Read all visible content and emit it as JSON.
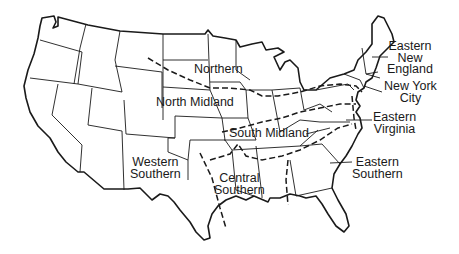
{
  "map": {
    "title": "",
    "subject": "United States dialect regions",
    "colors": {
      "line": "#1a1a1a",
      "background": "#ffffff"
    },
    "regions": [
      {
        "id": "northern",
        "label": "Northern"
      },
      {
        "id": "north-midland",
        "label": "North Midland"
      },
      {
        "id": "south-midland",
        "label": "South Midland"
      },
      {
        "id": "western-southern",
        "label_line1": "Western",
        "label_line2": "Southern"
      },
      {
        "id": "central-southern",
        "label_line1": "Central",
        "label_line2": "Southern"
      },
      {
        "id": "eastern-new-england",
        "label_line1": "Eastern",
        "label_line2": "New",
        "label_line3": "England"
      },
      {
        "id": "new-york-city",
        "label_line1": "New York",
        "label_line2": "City"
      },
      {
        "id": "eastern-virginia",
        "label_line1": "Eastern",
        "label_line2": "Virginia"
      },
      {
        "id": "eastern-southern",
        "label_line1": "Eastern",
        "label_line2": "Southern"
      }
    ]
  }
}
